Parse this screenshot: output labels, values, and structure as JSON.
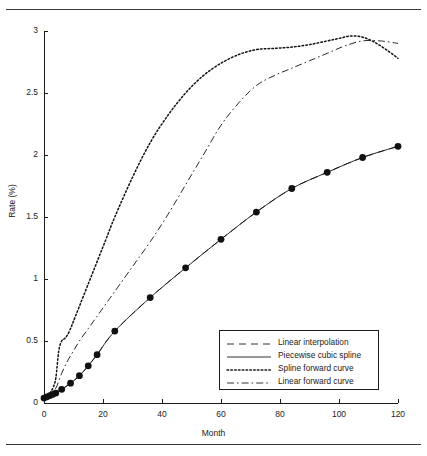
{
  "figure": {
    "xlabel": "Month",
    "ylabel": "Rate (%)"
  },
  "axis": {
    "x_ticks": [
      "0",
      "20",
      "40",
      "60",
      "80",
      "100",
      "120"
    ],
    "y_ticks": [
      "0",
      "0.5",
      "1",
      "1.5",
      "2",
      "2.5",
      "3"
    ]
  },
  "legend": {
    "items": [
      {
        "label": "Linear interpolation",
        "style": "dashed"
      },
      {
        "label": "Piecewise cubic spline",
        "style": "solid"
      },
      {
        "label": "Spline forward curve",
        "style": "dotted"
      },
      {
        "label": "Linear forward curve",
        "style": "dashdot"
      }
    ]
  },
  "chart_data": {
    "type": "line",
    "title": "",
    "xlabel": "Month",
    "ylabel": "Rate (%)",
    "xlim": [
      0,
      120
    ],
    "ylim": [
      0,
      3
    ],
    "xticks": [
      0,
      20,
      40,
      60,
      80,
      100,
      120
    ],
    "yticks": [
      0,
      0.5,
      1,
      1.5,
      2,
      2.5,
      3
    ],
    "grid": false,
    "legend_position": "lower-right-inside",
    "marker_color": "#111111",
    "line_color": "#111111",
    "series": [
      {
        "name": "Linear interpolation",
        "style": "dashed",
        "markers": false,
        "points": [
          [
            0,
            0.04
          ],
          [
            1,
            0.05
          ],
          [
            2,
            0.06
          ],
          [
            3,
            0.07
          ],
          [
            4,
            0.08
          ],
          [
            6,
            0.11
          ],
          [
            9,
            0.16
          ],
          [
            12,
            0.22
          ],
          [
            15,
            0.3
          ],
          [
            18,
            0.39
          ],
          [
            24,
            0.58
          ],
          [
            36,
            0.85
          ],
          [
            48,
            1.09
          ],
          [
            60,
            1.32
          ],
          [
            72,
            1.54
          ],
          [
            84,
            1.73
          ],
          [
            96,
            1.86
          ],
          [
            108,
            1.98
          ],
          [
            120,
            2.07
          ]
        ]
      },
      {
        "name": "Piecewise cubic spline",
        "style": "solid",
        "markers": true,
        "marker_points": [
          [
            0,
            0.04
          ],
          [
            1,
            0.05
          ],
          [
            2,
            0.06
          ],
          [
            3,
            0.07
          ],
          [
            4,
            0.08
          ],
          [
            6,
            0.11
          ],
          [
            9,
            0.16
          ],
          [
            12,
            0.22
          ],
          [
            15,
            0.3
          ],
          [
            18,
            0.39
          ],
          [
            24,
            0.58
          ],
          [
            36,
            0.85
          ],
          [
            48,
            1.09
          ],
          [
            60,
            1.32
          ],
          [
            72,
            1.54
          ],
          [
            84,
            1.73
          ],
          [
            96,
            1.86
          ],
          [
            108,
            1.98
          ],
          [
            120,
            2.07
          ]
        ],
        "points": [
          [
            0,
            0.04
          ],
          [
            1,
            0.05
          ],
          [
            2,
            0.06
          ],
          [
            3,
            0.07
          ],
          [
            4,
            0.08
          ],
          [
            6,
            0.11
          ],
          [
            9,
            0.16
          ],
          [
            12,
            0.22
          ],
          [
            15,
            0.3
          ],
          [
            18,
            0.39
          ],
          [
            24,
            0.58
          ],
          [
            36,
            0.85
          ],
          [
            48,
            1.09
          ],
          [
            60,
            1.32
          ],
          [
            72,
            1.54
          ],
          [
            84,
            1.73
          ],
          [
            96,
            1.86
          ],
          [
            108,
            1.98
          ],
          [
            120,
            2.07
          ]
        ]
      },
      {
        "name": "Spline forward curve",
        "style": "dotted",
        "markers": false,
        "points": [
          [
            0,
            0.04
          ],
          [
            1,
            0.06
          ],
          [
            2,
            0.08
          ],
          [
            3,
            0.12
          ],
          [
            4,
            0.2
          ],
          [
            5,
            0.42
          ],
          [
            6,
            0.5
          ],
          [
            7,
            0.52
          ],
          [
            8,
            0.55
          ],
          [
            9,
            0.6
          ],
          [
            10,
            0.66
          ],
          [
            12,
            0.78
          ],
          [
            15,
            0.96
          ],
          [
            18,
            1.14
          ],
          [
            21,
            1.32
          ],
          [
            24,
            1.5
          ],
          [
            30,
            1.82
          ],
          [
            36,
            2.1
          ],
          [
            42,
            2.32
          ],
          [
            48,
            2.5
          ],
          [
            54,
            2.64
          ],
          [
            60,
            2.74
          ],
          [
            66,
            2.81
          ],
          [
            72,
            2.85
          ],
          [
            78,
            2.86
          ],
          [
            84,
            2.87
          ],
          [
            90,
            2.89
          ],
          [
            96,
            2.92
          ],
          [
            100,
            2.94
          ],
          [
            104,
            2.96
          ],
          [
            108,
            2.95
          ],
          [
            112,
            2.91
          ],
          [
            116,
            2.85
          ],
          [
            120,
            2.78
          ]
        ]
      },
      {
        "name": "Linear forward curve",
        "style": "dashdot",
        "markers": false,
        "points": [
          [
            0,
            0.04
          ],
          [
            2,
            0.07
          ],
          [
            4,
            0.12
          ],
          [
            6,
            0.24
          ],
          [
            8,
            0.34
          ],
          [
            10,
            0.42
          ],
          [
            12,
            0.5
          ],
          [
            15,
            0.6
          ],
          [
            18,
            0.7
          ],
          [
            21,
            0.8
          ],
          [
            24,
            0.9
          ],
          [
            30,
            1.1
          ],
          [
            36,
            1.3
          ],
          [
            42,
            1.52
          ],
          [
            48,
            1.76
          ],
          [
            54,
            2.0
          ],
          [
            60,
            2.24
          ],
          [
            66,
            2.42
          ],
          [
            72,
            2.56
          ],
          [
            78,
            2.64
          ],
          [
            84,
            2.7
          ],
          [
            90,
            2.76
          ],
          [
            96,
            2.82
          ],
          [
            102,
            2.88
          ],
          [
            108,
            2.92
          ],
          [
            114,
            2.92
          ],
          [
            120,
            2.9
          ]
        ]
      }
    ]
  }
}
